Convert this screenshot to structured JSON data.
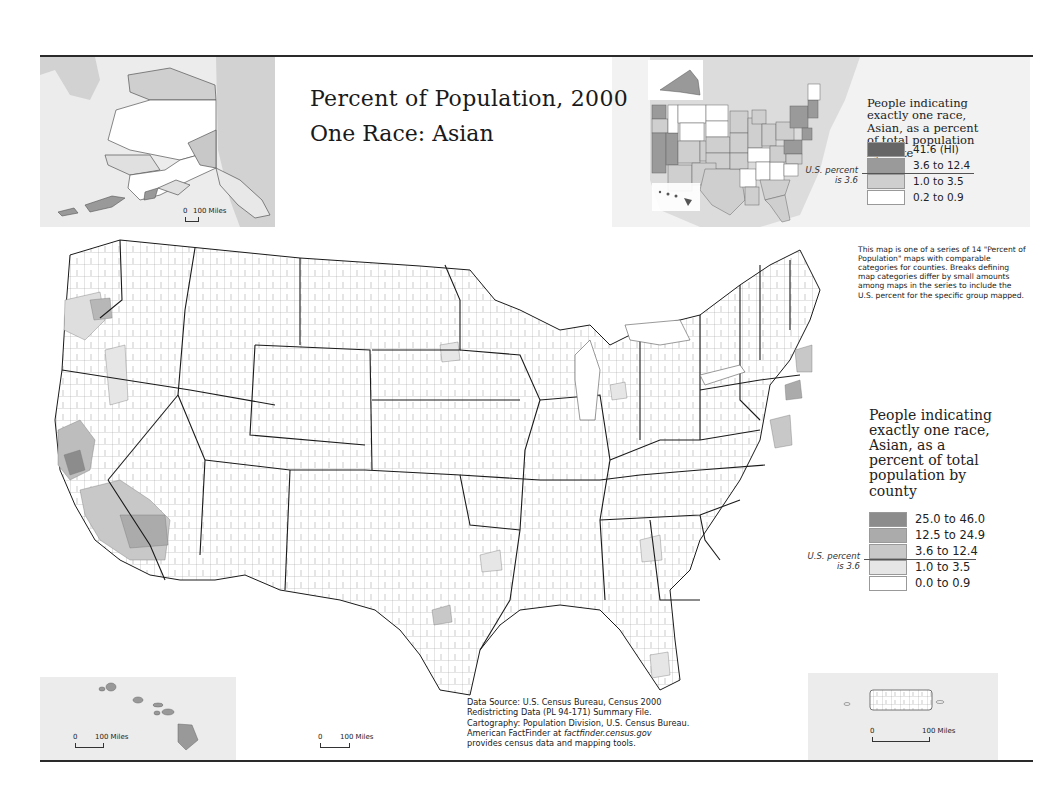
{
  "map": {
    "title": "Percent of Population, 2000",
    "subtitle": "One Race: Asian",
    "colors": {
      "class_5": "#7d7d7d",
      "class_4": "#a2a2a2",
      "class_3": "#c4c4c4",
      "class_2": "#e2e2e2",
      "class_1": "#ffffff",
      "state_border": "#1a1a1a",
      "county_border": "#6a6a6a",
      "inset_bg": "#ececec"
    }
  },
  "state_legend": {
    "title_lines": [
      "People indicating",
      "exactly one race,",
      "Asian, as a percent",
      "of total population",
      "by state"
    ],
    "classes": [
      {
        "label": "41.6 (HI)",
        "color": "#666666"
      },
      {
        "label": "3.6 to 12.4",
        "color": "#9a9a9a"
      },
      {
        "label": "1.0 to 3.5",
        "color": "#cfcfcf"
      },
      {
        "label": "0.2 to 0.9",
        "color": "#ffffff"
      }
    ],
    "us_percent_note_line1": "U.S. percent",
    "us_percent_note_line2": "is 3.6"
  },
  "county_legend": {
    "title_lines": [
      "People indicating",
      "exactly one race,",
      "Asian, as a",
      "percent of total",
      "population by",
      "county"
    ],
    "classes": [
      {
        "label": "25.0 to 46.0",
        "color": "#8c8c8c"
      },
      {
        "label": "12.5 to 24.9",
        "color": "#ababab"
      },
      {
        "label": "3.6 to 12.4",
        "color": "#c8c8c8"
      },
      {
        "label": "1.0 to 3.5",
        "color": "#e6e6e6"
      },
      {
        "label": "0.0 to 0.9",
        "color": "#ffffff"
      }
    ],
    "us_percent_note_line1": "U.S. percent",
    "us_percent_note_line2": "is 3.6"
  },
  "series_note": "This map is one of a series of 14 \"Percent of Population\" maps with comparable categories for counties. Breaks defining map categories differ by small amounts among maps in the series to include the U.S. percent for the specific group mapped.",
  "source": {
    "line1": "Data Source: U.S. Census Bureau, Census 2000",
    "line2": "Redistricting Data (PL 94-171) Summary File.",
    "line3": "Cartography: Population Division, U.S. Census Bureau.",
    "line4_prefix": "American FactFinder at ",
    "line4_link": "factfinder.census.gov",
    "line5": "provides census data and mapping tools."
  },
  "scale_bars": {
    "alaska": {
      "zero": "0",
      "label": "100 Miles"
    },
    "hawaii": {
      "zero": "0",
      "label": "100 Miles"
    },
    "conus": {
      "zero": "0",
      "label": "100 Miles"
    },
    "puerto_rico": {
      "zero": "0",
      "label": "100 Miles"
    }
  },
  "insets": [
    "Alaska",
    "Hawaii",
    "Puerto Rico",
    "State locator map"
  ]
}
